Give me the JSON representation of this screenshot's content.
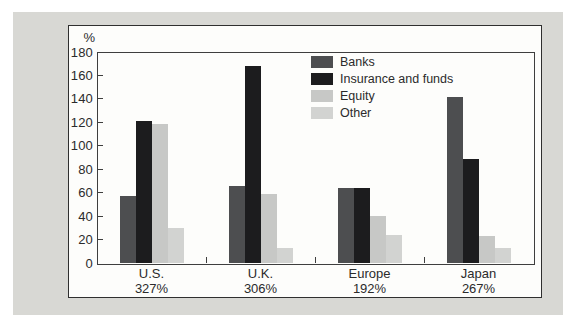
{
  "chart_data": {
    "type": "bar",
    "title": "",
    "ylabel": "%",
    "xlabel": "",
    "ylim": [
      0,
      180
    ],
    "ytick_step": 20,
    "y_tick_labels": [
      "180",
      "160",
      "140",
      "120",
      "100",
      "80",
      "60",
      "40",
      "20",
      "0"
    ],
    "grid": false,
    "legend_position": "top-center",
    "categories": [
      "U.S.",
      "U.K.",
      "Europe",
      "Japan"
    ],
    "category_totals": [
      "327%",
      "306%",
      "192%",
      "267%"
    ],
    "series": [
      {
        "name": "Banks",
        "color": "#4d4e50",
        "values": [
          57,
          66,
          64,
          142
        ]
      },
      {
        "name": "Insurance and funds",
        "color": "#1c1c1e",
        "values": [
          121,
          168,
          64,
          89
        ]
      },
      {
        "name": "Equity",
        "color": "#c7c8c6",
        "values": [
          119,
          59,
          40,
          23
        ]
      },
      {
        "name": "Other",
        "color": "#d2d3d1",
        "values": [
          30,
          13,
          24,
          13
        ]
      }
    ]
  },
  "frame": {
    "background_color": "#d8d8d4",
    "panel_color": "#fdfdfb",
    "border_color": "#2f2f2f"
  }
}
